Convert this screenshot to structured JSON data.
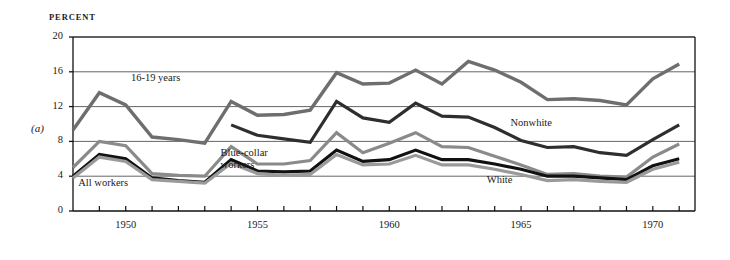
{
  "figure": {
    "panel_id": "(a)",
    "y_axis_unit": "PERCENT"
  },
  "chart_data": {
    "type": "line",
    "title": "",
    "subtitle": "",
    "xlabel": "",
    "ylabel": "PERCENT",
    "ylim": [
      0,
      20
    ],
    "xlim": [
      1948,
      1971.6
    ],
    "yticks": [
      0,
      4,
      8,
      12,
      16,
      20
    ],
    "ytick_labels": [
      "0",
      "4",
      "8",
      "12",
      "16",
      "20"
    ],
    "xticks": [
      1949,
      1950,
      1951,
      1952,
      1953,
      1954,
      1955,
      1956,
      1957,
      1958,
      1959,
      1960,
      1961,
      1962,
      1963,
      1964,
      1965,
      1966,
      1967,
      1968,
      1969,
      1970,
      1971
    ],
    "xtick_labels": [
      "1950",
      "1955",
      "1960",
      "1965",
      "1970"
    ],
    "xtick_label_values": [
      1950,
      1955,
      1960,
      1965,
      1970
    ],
    "grid": "horizontal",
    "legend": "inline-annotations",
    "series": [
      {
        "name": "16-19 years",
        "color": "#6e6e6e",
        "width": 3.4,
        "x": [
          1948,
          1949,
          1950,
          1951,
          1952,
          1953,
          1954,
          1955,
          1956,
          1957,
          1958,
          1959,
          1960,
          1961,
          1962,
          1963,
          1964,
          1965,
          1966,
          1967,
          1968,
          1969,
          1970,
          1971
        ],
        "values": [
          9.3,
          13.6,
          12.2,
          8.5,
          8.2,
          7.8,
          12.6,
          11.0,
          11.1,
          11.6,
          15.9,
          14.6,
          14.7,
          16.2,
          14.6,
          17.2,
          16.2,
          14.8,
          12.8,
          12.9,
          12.7,
          12.2,
          15.2,
          16.9
        ]
      },
      {
        "name": "Nonwhite",
        "color": "#2e2e2e",
        "width": 3.2,
        "x": [
          1954,
          1955,
          1956,
          1957,
          1958,
          1959,
          1960,
          1961,
          1962,
          1963,
          1964,
          1965,
          1966,
          1967,
          1968,
          1969,
          1970,
          1971
        ],
        "values": [
          9.9,
          8.7,
          8.3,
          7.9,
          12.6,
          10.7,
          10.2,
          12.4,
          10.9,
          10.8,
          9.6,
          8.1,
          7.3,
          7.4,
          6.7,
          6.4,
          8.2,
          9.9
        ]
      },
      {
        "name": "Blue-collar workers",
        "color": "#8a8a8a",
        "width": 3.2,
        "x": [
          1948,
          1949,
          1950,
          1951,
          1952,
          1953,
          1954,
          1955,
          1956,
          1957,
          1958,
          1959,
          1960,
          1961,
          1962,
          1963,
          1964,
          1965,
          1966,
          1967,
          1968,
          1969,
          1970,
          1971
        ],
        "values": [
          5.0,
          8.0,
          7.5,
          4.3,
          4.1,
          4.0,
          7.4,
          5.4,
          5.4,
          5.8,
          9.0,
          6.7,
          7.8,
          9.0,
          7.4,
          7.3,
          6.3,
          5.3,
          4.2,
          4.3,
          4.0,
          3.9,
          6.2,
          7.7
        ]
      },
      {
        "name": "All workers",
        "color": "#111111",
        "width": 3.2,
        "x": [
          1948,
          1949,
          1950,
          1951,
          1952,
          1953,
          1954,
          1955,
          1956,
          1957,
          1958,
          1959,
          1960,
          1961,
          1962,
          1963,
          1964,
          1965,
          1966,
          1967,
          1968,
          1969,
          1970,
          1971
        ],
        "values": [
          4.0,
          6.5,
          6.0,
          3.8,
          3.5,
          3.3,
          5.9,
          4.6,
          4.5,
          4.6,
          7.0,
          5.7,
          5.9,
          7.0,
          5.9,
          5.9,
          5.4,
          4.8,
          4.0,
          4.0,
          3.8,
          3.6,
          5.2,
          6.0
        ]
      },
      {
        "name": "White",
        "color": "#9a9a9a",
        "width": 3.2,
        "x": [
          1948,
          1949,
          1950,
          1951,
          1952,
          1953,
          1954,
          1955,
          1956,
          1957,
          1958,
          1959,
          1960,
          1961,
          1962,
          1963,
          1964,
          1965,
          1966,
          1967,
          1968,
          1969,
          1970,
          1971
        ],
        "values": [
          3.8,
          6.2,
          5.7,
          3.6,
          3.4,
          3.2,
          5.5,
          4.3,
          4.1,
          4.2,
          6.5,
          5.3,
          5.4,
          6.4,
          5.3,
          5.3,
          4.8,
          4.2,
          3.5,
          3.6,
          3.4,
          3.3,
          4.8,
          5.6
        ]
      }
    ],
    "annotations": [
      {
        "text": "16-19 years",
        "x": 1950.2,
        "y": 15.2,
        "name": "label-16-19-years"
      },
      {
        "text": "Blue-collar\nworkers",
        "x": 1953.6,
        "y": 6.6,
        "name": "label-blue-collar-workers"
      },
      {
        "text": "All workers",
        "x": 1948.2,
        "y": 3.1,
        "name": "label-all-workers"
      },
      {
        "text": "Nonwhite",
        "x": 1964.6,
        "y": 10.0,
        "name": "label-nonwhite"
      },
      {
        "text": "White",
        "x": 1963.7,
        "y": 3.4,
        "name": "label-white"
      }
    ],
    "axis_color": "#111111",
    "grid_color": "#555555"
  }
}
